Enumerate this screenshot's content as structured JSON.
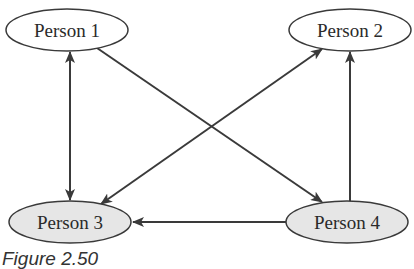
{
  "diagram": {
    "type": "directed-graph",
    "colors": {
      "stroke": "#3a3a3a",
      "node_fill_top": "#ffffff",
      "node_fill_bottom": "#e6e6e6",
      "text": "#2a2a2a"
    },
    "nodes": [
      {
        "id": "p1",
        "label": "Person 1",
        "cx": 67,
        "cy": 30,
        "fill": "#ffffff"
      },
      {
        "id": "p2",
        "label": "Person 2",
        "cx": 350,
        "cy": 30,
        "fill": "#ffffff"
      },
      {
        "id": "p3",
        "label": "Person 3",
        "cx": 70,
        "cy": 222,
        "fill": "#e6e6e6"
      },
      {
        "id": "p4",
        "label": "Person 4",
        "cx": 347,
        "cy": 222,
        "fill": "#e6e6e6"
      }
    ],
    "edges": [
      {
        "from": "Person 1",
        "to": "Person 3",
        "bidirectional": true
      },
      {
        "from": "Person 1",
        "to": "Person 4",
        "bidirectional": false
      },
      {
        "from": "Person 2",
        "to": "Person 3",
        "bidirectional": true
      },
      {
        "from": "Person 4",
        "to": "Person 2",
        "bidirectional": false
      },
      {
        "from": "Person 4",
        "to": "Person 3",
        "bidirectional": false
      }
    ]
  },
  "caption": {
    "text": "Figure 2.50"
  }
}
